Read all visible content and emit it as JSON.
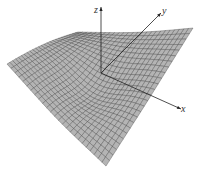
{
  "chart_data": {
    "type": "surface3d",
    "title": "",
    "axes": {
      "x": {
        "label": "x",
        "tip": [
          181,
          109
        ]
      },
      "y": {
        "label": "y",
        "tip": [
          161,
          13
        ]
      },
      "z": {
        "label": "z",
        "tip": [
          101,
          7
        ]
      },
      "origin": [
        101,
        73
      ]
    },
    "grid": {
      "u_lines": 26,
      "v_lines": 26
    },
    "surface_corners_px": {
      "left": [
        7,
        64
      ],
      "back": [
        78,
        32
      ],
      "right": [
        193,
        28
      ],
      "front": [
        106,
        166
      ]
    },
    "colors": {
      "surface_fill": "#b4b4b4",
      "grid_line": "#3a3a3a",
      "axis": "#222222",
      "background": "#ffffff"
    },
    "xlabel": "x",
    "ylabel": "y",
    "zlabel": "z",
    "legend": []
  }
}
